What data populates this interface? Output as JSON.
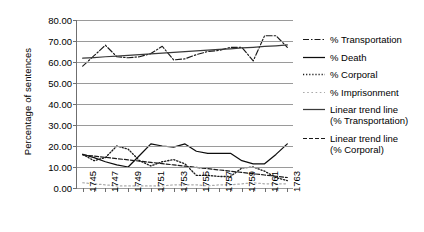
{
  "chart_data": {
    "type": "line",
    "title": "",
    "xlabel": "",
    "ylabel": "Percentage of sentences",
    "xlim": [
      1744.5,
      1763.5
    ],
    "ylim": [
      0,
      80
    ],
    "ytick_labels": [
      "0.00",
      "10.00",
      "20.00",
      "30.00",
      "40.00",
      "50.00",
      "60.00",
      "70.00",
      "80.00"
    ],
    "ytick_values": [
      0,
      10,
      20,
      30,
      40,
      50,
      60,
      70,
      80
    ],
    "grid": "horizontal",
    "legend_position": "right",
    "x": [
      1745,
      1746,
      1747,
      1748,
      1749,
      1750,
      1751,
      1752,
      1753,
      1754,
      1755,
      1756,
      1757,
      1758,
      1759,
      1760,
      1761,
      1762,
      1763
    ],
    "xtick_labels": [
      "1745",
      "1747",
      "1749",
      "1751",
      "1753",
      "1755",
      "1757",
      "1759",
      "1761",
      "1763"
    ],
    "xtick_values": [
      1745,
      1747,
      1749,
      1751,
      1753,
      1755,
      1757,
      1759,
      1761,
      1763
    ],
    "series": [
      {
        "name": "% Transportation",
        "style": "dash-dot",
        "color": "#1a1a1a",
        "values": [
          58.0,
          63.0,
          68.0,
          62.5,
          62.0,
          62.5,
          64.0,
          67.5,
          61.0,
          61.5,
          63.5,
          65.0,
          65.5,
          67.0,
          67.0,
          60.5,
          72.5,
          72.5,
          67.0
        ]
      },
      {
        "name": "% Death",
        "style": "solid",
        "color": "#0d0d0d",
        "values": [
          16.0,
          14.5,
          12.5,
          11.0,
          10.0,
          15.5,
          21.0,
          20.0,
          19.5,
          21.0,
          17.5,
          16.5,
          16.5,
          16.5,
          13.0,
          11.5,
          11.5,
          16.0,
          21.0
        ]
      },
      {
        "name": "% Corporal",
        "style": "dotted",
        "color": "#1a1a1a",
        "values": [
          16.0,
          13.0,
          14.5,
          20.0,
          18.5,
          13.0,
          10.5,
          12.5,
          13.5,
          11.5,
          6.0,
          6.0,
          5.5,
          5.5,
          9.5,
          10.0,
          8.0,
          5.0,
          3.5
        ]
      },
      {
        "name": "% Imprisonment",
        "style": "light-dotted",
        "color": "#aaaaaa",
        "values": [
          2.5,
          2.0,
          1.5,
          1.0,
          1.0,
          1.0,
          1.0,
          1.0,
          1.5,
          1.5,
          1.5,
          1.0,
          1.5,
          1.5,
          2.0,
          2.5,
          2.0,
          2.0,
          2.0
        ]
      },
      {
        "name": "Linear trend line\n(% Transportation)",
        "style": "solid",
        "color": "#3a3a3a",
        "values": [
          61.8,
          62.1,
          62.5,
          62.8,
          63.2,
          63.5,
          63.9,
          64.2,
          64.6,
          64.9,
          65.3,
          65.6,
          66.0,
          66.3,
          66.7,
          67.0,
          67.4,
          67.7,
          68.1
        ]
      },
      {
        "name": "Linear trend line\n(% Corporal)",
        "style": "dashed",
        "color": "#1a1a1a",
        "values": [
          15.8,
          15.2,
          14.6,
          14.0,
          13.4,
          12.8,
          12.2,
          11.6,
          11.0,
          10.4,
          9.8,
          9.2,
          8.6,
          8.0,
          7.4,
          6.8,
          6.2,
          5.6,
          5.0
        ]
      }
    ]
  },
  "legend": {
    "items": [
      {
        "label": "% Transportation"
      },
      {
        "label": "% Death"
      },
      {
        "label": "% Corporal"
      },
      {
        "label": "% Imprisonment"
      },
      {
        "label": "Linear trend line\n(% Transportation)"
      },
      {
        "label": "Linear trend line\n(% Corporal)"
      }
    ]
  }
}
